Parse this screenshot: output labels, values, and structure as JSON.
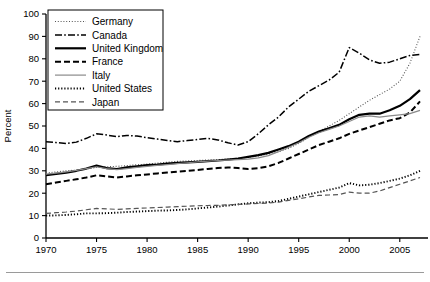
{
  "chart_data": {
    "type": "line",
    "title": "",
    "xlabel": "",
    "ylabel": "Percent",
    "xlim": [
      1970,
      2007
    ],
    "ylim": [
      0,
      100
    ],
    "yticks": [
      0,
      10,
      20,
      30,
      40,
      50,
      60,
      70,
      80,
      90,
      100
    ],
    "xticks": [
      1970,
      1975,
      1980,
      1985,
      1990,
      1995,
      2000,
      2005
    ],
    "grid": false,
    "legend_position": "top-left",
    "x": [
      1970,
      1971,
      1972,
      1973,
      1974,
      1975,
      1976,
      1977,
      1978,
      1979,
      1980,
      1981,
      1982,
      1983,
      1984,
      1985,
      1986,
      1987,
      1988,
      1989,
      1990,
      1991,
      1992,
      1993,
      1994,
      1995,
      1996,
      1997,
      1998,
      1999,
      2000,
      2001,
      2002,
      2003,
      2004,
      2005,
      2006,
      2007
    ],
    "series": [
      {
        "name": "Germany",
        "style": "dotted-fine",
        "color": "#555555",
        "values": [
          29.0,
          29.5,
          30.0,
          30.3,
          30.8,
          31.5,
          31.8,
          32.0,
          32.3,
          32.7,
          33.0,
          33.4,
          33.8,
          34.2,
          34.4,
          34.6,
          34.8,
          35.0,
          35.3,
          35.6,
          36.0,
          36.6,
          37.5,
          38.5,
          40.0,
          42.2,
          45.0,
          47.5,
          50.0,
          52.5,
          55.5,
          58.5,
          61.5,
          64.0,
          66.5,
          70.0,
          78.0,
          90.0
        ]
      },
      {
        "name": "Canada",
        "style": "dash-dot",
        "color": "#000000",
        "values": [
          43.0,
          42.6,
          42.2,
          42.8,
          44.5,
          46.5,
          46.0,
          45.2,
          45.8,
          45.5,
          44.8,
          44.2,
          43.5,
          43.0,
          43.5,
          44.0,
          44.5,
          43.8,
          42.5,
          41.5,
          43.0,
          46.5,
          50.5,
          54.0,
          58.5,
          62.0,
          65.5,
          68.0,
          70.5,
          74.0,
          85.0,
          82.5,
          79.5,
          78.0,
          78.5,
          80.0,
          81.5,
          82.0
        ]
      },
      {
        "name": "United Kingdom",
        "style": "solid-thick",
        "color": "#000000",
        "values": [
          28.0,
          28.6,
          29.2,
          30.0,
          31.0,
          32.3,
          31.2,
          30.8,
          31.5,
          32.0,
          32.5,
          32.8,
          33.2,
          33.5,
          33.8,
          34.0,
          34.3,
          34.6,
          35.0,
          35.5,
          36.2,
          37.0,
          38.0,
          39.5,
          41.0,
          43.0,
          45.5,
          47.5,
          49.0,
          50.5,
          53.0,
          55.0,
          55.5,
          55.5,
          57.0,
          59.0,
          62.0,
          66.0
        ]
      },
      {
        "name": "France",
        "style": "dashed-thick",
        "color": "#000000",
        "values": [
          24.0,
          24.8,
          25.5,
          26.2,
          27.0,
          28.0,
          27.5,
          27.0,
          27.5,
          28.0,
          28.4,
          28.8,
          29.2,
          29.6,
          30.0,
          30.4,
          30.8,
          31.2,
          31.5,
          31.2,
          30.8,
          31.2,
          32.0,
          33.5,
          35.5,
          37.5,
          39.5,
          41.5,
          43.0,
          44.5,
          46.5,
          48.0,
          49.5,
          51.0,
          52.5,
          53.5,
          56.0,
          61.0
        ]
      },
      {
        "name": "Italy",
        "style": "solid-thin",
        "color": "#8a8a8a",
        "values": [
          28.5,
          29.0,
          29.5,
          30.2,
          31.0,
          31.8,
          31.0,
          30.5,
          31.0,
          31.5,
          32.0,
          32.4,
          32.8,
          33.2,
          33.6,
          34.0,
          34.3,
          34.6,
          34.8,
          35.0,
          35.2,
          35.8,
          36.8,
          38.5,
          40.5,
          42.5,
          45.0,
          47.0,
          48.5,
          50.0,
          52.0,
          54.0,
          54.5,
          54.0,
          54.5,
          55.0,
          55.5,
          57.0
        ]
      },
      {
        "name": "United States",
        "style": "dotted-bold",
        "color": "#000000",
        "values": [
          10.0,
          10.1,
          10.3,
          10.6,
          11.0,
          11.0,
          11.1,
          11.3,
          11.6,
          11.8,
          12.0,
          12.2,
          12.3,
          12.5,
          12.8,
          13.2,
          13.6,
          14.0,
          14.5,
          15.0,
          15.5,
          15.8,
          16.0,
          16.5,
          17.5,
          18.5,
          19.5,
          20.5,
          21.5,
          22.5,
          24.5,
          23.5,
          23.8,
          24.5,
          25.5,
          26.5,
          28.0,
          30.0
        ]
      },
      {
        "name": "Japan",
        "style": "dashed-thin",
        "color": "#555555",
        "values": [
          11.0,
          11.3,
          11.6,
          12.0,
          12.6,
          13.2,
          13.0,
          12.8,
          13.0,
          13.2,
          13.4,
          13.6,
          13.8,
          14.0,
          14.2,
          14.4,
          14.5,
          14.6,
          14.8,
          15.0,
          15.2,
          15.4,
          15.6,
          16.0,
          16.8,
          17.5,
          18.3,
          19.0,
          19.2,
          19.4,
          20.5,
          20.0,
          20.0,
          21.0,
          22.5,
          24.0,
          25.5,
          27.0
        ]
      }
    ]
  },
  "legend": {
    "entries": [
      {
        "label": "Germany"
      },
      {
        "label": "Canada"
      },
      {
        "label": "United Kingdom"
      },
      {
        "label": "France"
      },
      {
        "label": "Italy"
      },
      {
        "label": "United States"
      },
      {
        "label": "Japan"
      }
    ]
  },
  "axes": {
    "y_title": "Percent",
    "y_labels": [
      "100",
      "90",
      "80",
      "70",
      "60",
      "50",
      "40",
      "30",
      "20",
      "10",
      "0"
    ],
    "x_labels": [
      "1970",
      "1975",
      "1980",
      "1985",
      "1990",
      "1995",
      "2000",
      "2005"
    ]
  }
}
